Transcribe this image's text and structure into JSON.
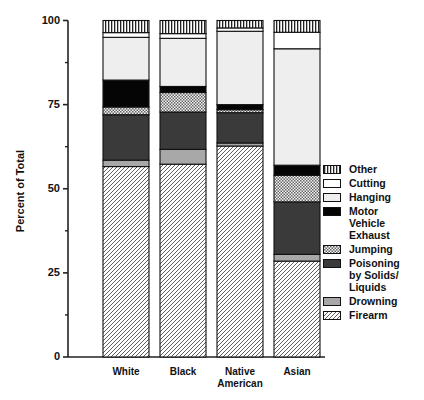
{
  "chart_data": {
    "type": "bar",
    "stacked": true,
    "title": "",
    "xlabel": "",
    "ylabel": "Percent of Total",
    "ylim": [
      0,
      100
    ],
    "yticks": [
      0,
      25,
      50,
      75,
      100
    ],
    "yminor_ticks": [
      12.5,
      37.5,
      62.5,
      87.5
    ],
    "grid": false,
    "legend_position": "right",
    "categories": [
      "White",
      "Black",
      "Native\nAmerican",
      "Asian"
    ],
    "category_lines": [
      [
        "White"
      ],
      [
        "Black"
      ],
      [
        "Native",
        "American"
      ],
      [
        "Asian"
      ]
    ],
    "series": [
      {
        "name": "Firearm",
        "pattern": "diagonal-hatch",
        "values": [
          56.6,
          57.3,
          62.7,
          28.5
        ]
      },
      {
        "name": "Drowning",
        "pattern": "solid-medium-gray",
        "color": "#a8a8a8",
        "values": [
          1.9,
          4.4,
          0.9,
          2.0
        ]
      },
      {
        "name": "Poisoning by Solids/ Liquids",
        "pattern": "solid-dark-gray",
        "color": "#3a3a3a",
        "values": [
          13.5,
          11.1,
          9.0,
          15.6
        ]
      },
      {
        "name": "Jumping",
        "pattern": "checkered",
        "values": [
          2.3,
          5.8,
          0.9,
          7.9
        ]
      },
      {
        "name": "Motor Vehicle Exhaust",
        "pattern": "solid-black",
        "color": "#050505",
        "values": [
          8.0,
          1.8,
          1.5,
          3.0
        ]
      },
      {
        "name": "Hanging",
        "pattern": "solid-light-gray",
        "color": "#eeeeee",
        "values": [
          12.7,
          14.3,
          21.8,
          34.6
        ]
      },
      {
        "name": "Cutting",
        "pattern": "solid-white",
        "color": "#ffffff",
        "values": [
          1.4,
          1.4,
          1.0,
          4.9
        ]
      },
      {
        "name": "Other",
        "pattern": "vertical-stripes",
        "values": [
          3.6,
          3.9,
          2.2,
          3.5
        ]
      }
    ],
    "legend_order": [
      "Other",
      "Cutting",
      "Hanging",
      "Motor Vehicle Exhaust",
      "Jumping",
      "Poisoning by Solids/ Liquids",
      "Drowning",
      "Firearm"
    ],
    "legend_lines": [
      [
        "Other"
      ],
      [
        "Cutting"
      ],
      [
        "Hanging"
      ],
      [
        "Motor",
        "Vehicle",
        "Exhaust"
      ],
      [
        "Jumping"
      ],
      [
        "Poisoning",
        "by Solids/",
        "Liquids"
      ],
      [
        "Drowning"
      ],
      [
        "Firearm"
      ]
    ]
  },
  "axis": {
    "ylabel": "Percent of Total",
    "tick_labels": [
      "0",
      "25",
      "50",
      "75",
      "100"
    ]
  }
}
